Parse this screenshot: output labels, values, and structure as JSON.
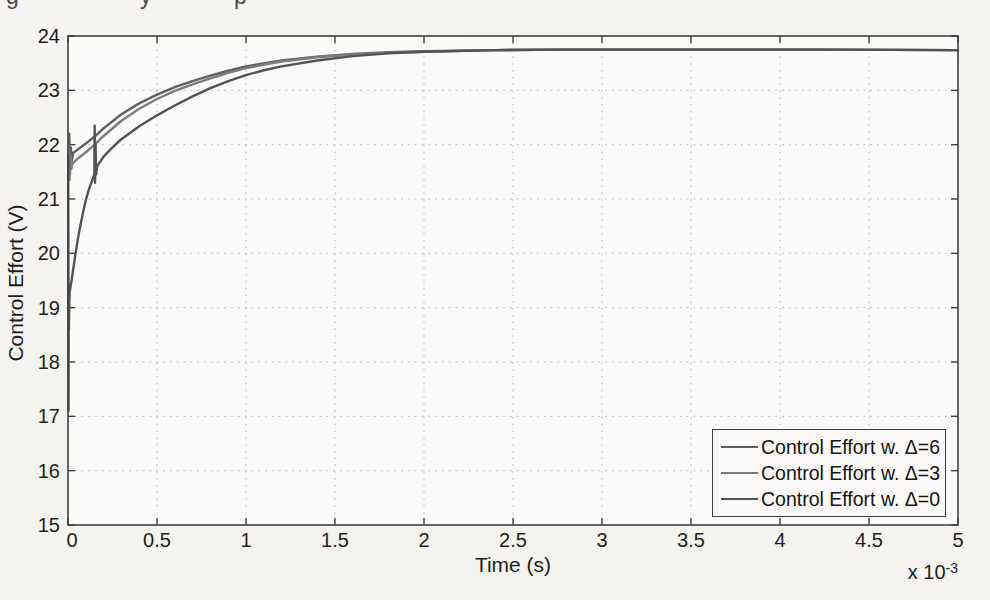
{
  "page": {
    "top_text_fragments": [
      {
        "glyph": "g",
        "x": 6
      },
      {
        "glyph": "y",
        "x": 140
      },
      {
        "glyph": "p",
        "x": 234
      }
    ]
  },
  "chart_data": {
    "type": "line",
    "title": "",
    "xlabel": "Time (s)",
    "x_multiplier_base": "x 10",
    "x_multiplier_exp": "-3",
    "ylabel": "Control Effort (V)",
    "xlim": [
      0,
      5
    ],
    "ylim": [
      15,
      24
    ],
    "grid": true,
    "legend_position": "bottom-right",
    "axis_color": "#3f3f3f",
    "grid_color": "#b5b5b5",
    "plot_bg": "#fbfaf8",
    "xticks": [
      0,
      0.5,
      1,
      1.5,
      2,
      2.5,
      3,
      3.5,
      4,
      4.5,
      5
    ],
    "xtick_labels": [
      "0",
      "0.5",
      "1",
      "1.5",
      "2",
      "2.5",
      "3",
      "3.5",
      "4",
      "4.5",
      "5"
    ],
    "yticks": [
      15,
      16,
      17,
      18,
      19,
      20,
      21,
      22,
      23,
      24
    ],
    "ytick_labels": [
      "15",
      "16",
      "17",
      "18",
      "19",
      "20",
      "21",
      "22",
      "23",
      "24"
    ],
    "series": [
      {
        "name": "Control Effort  w. Δ=6",
        "color": "#5f5f5f",
        "points": [
          [
            0.004,
            21.6
          ],
          [
            0.007,
            22.2
          ],
          [
            0.011,
            21.45
          ],
          [
            0.016,
            21.95
          ],
          [
            0.021,
            21.7
          ],
          [
            0.03,
            21.85
          ],
          [
            0.05,
            21.9
          ],
          [
            0.1,
            22.02
          ],
          [
            0.15,
            22.15
          ],
          [
            0.2,
            22.3
          ],
          [
            0.3,
            22.56
          ],
          [
            0.4,
            22.76
          ],
          [
            0.5,
            22.92
          ],
          [
            0.6,
            23.06
          ],
          [
            0.7,
            23.17
          ],
          [
            0.8,
            23.27
          ],
          [
            0.9,
            23.36
          ],
          [
            1.0,
            23.44
          ],
          [
            1.2,
            23.55
          ],
          [
            1.4,
            23.62
          ],
          [
            1.6,
            23.67
          ],
          [
            1.8,
            23.7
          ],
          [
            2.0,
            23.72
          ],
          [
            2.4,
            23.74
          ],
          [
            2.8,
            23.75
          ],
          [
            3.5,
            23.75
          ],
          [
            4.2,
            23.75
          ],
          [
            5.0,
            23.74
          ]
        ]
      },
      {
        "name": "Control Effort  w. Δ=3",
        "color": "#7c7c7c",
        "points": [
          [
            0.004,
            22.0
          ],
          [
            0.008,
            21.35
          ],
          [
            0.013,
            21.8
          ],
          [
            0.018,
            21.55
          ],
          [
            0.025,
            21.65
          ],
          [
            0.05,
            21.73
          ],
          [
            0.1,
            21.86
          ],
          [
            0.15,
            22.0
          ],
          [
            0.2,
            22.16
          ],
          [
            0.3,
            22.44
          ],
          [
            0.4,
            22.66
          ],
          [
            0.5,
            22.84
          ],
          [
            0.6,
            22.99
          ],
          [
            0.7,
            23.11
          ],
          [
            0.8,
            23.22
          ],
          [
            0.9,
            23.32
          ],
          [
            1.0,
            23.41
          ],
          [
            1.2,
            23.53
          ],
          [
            1.4,
            23.61
          ],
          [
            1.6,
            23.66
          ],
          [
            1.8,
            23.69
          ],
          [
            2.0,
            23.71
          ],
          [
            2.4,
            23.74
          ],
          [
            2.8,
            23.75
          ],
          [
            3.5,
            23.75
          ],
          [
            4.2,
            23.75
          ],
          [
            5.0,
            23.74
          ]
        ]
      },
      {
        "name": "Control Effort  w. Δ=0",
        "color": "#535353",
        "points": [
          [
            0.001,
            21.8
          ],
          [
            0.002,
            20.5
          ],
          [
            0.003,
            17.1
          ],
          [
            0.004,
            19.0
          ],
          [
            0.005,
            18.6
          ],
          [
            0.007,
            19.1
          ],
          [
            0.01,
            19.3
          ],
          [
            0.02,
            19.5
          ],
          [
            0.04,
            19.95
          ],
          [
            0.06,
            20.35
          ],
          [
            0.08,
            20.68
          ],
          [
            0.1,
            20.98
          ],
          [
            0.12,
            21.2
          ],
          [
            0.14,
            21.38
          ],
          [
            0.148,
            21.45
          ],
          [
            0.15,
            22.35
          ],
          [
            0.152,
            21.3
          ],
          [
            0.155,
            22.0
          ],
          [
            0.158,
            21.45
          ],
          [
            0.163,
            21.6
          ],
          [
            0.2,
            21.78
          ],
          [
            0.25,
            21.95
          ],
          [
            0.3,
            22.1
          ],
          [
            0.4,
            22.34
          ],
          [
            0.5,
            22.54
          ],
          [
            0.6,
            22.72
          ],
          [
            0.7,
            22.89
          ],
          [
            0.8,
            23.04
          ],
          [
            0.9,
            23.17
          ],
          [
            1.0,
            23.28
          ],
          [
            1.1,
            23.37
          ],
          [
            1.2,
            23.44
          ],
          [
            1.4,
            23.55
          ],
          [
            1.6,
            23.63
          ],
          [
            1.8,
            23.68
          ],
          [
            2.0,
            23.71
          ],
          [
            2.4,
            23.74
          ],
          [
            2.8,
            23.75
          ],
          [
            3.5,
            23.75
          ],
          [
            4.2,
            23.75
          ],
          [
            5.0,
            23.74
          ]
        ]
      }
    ]
  }
}
